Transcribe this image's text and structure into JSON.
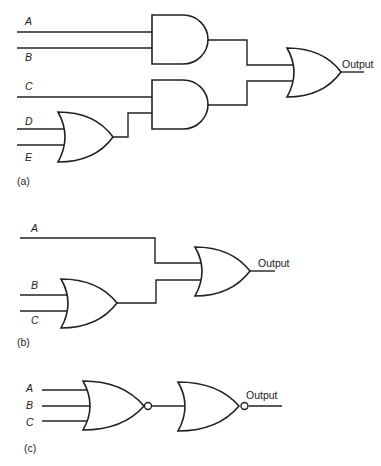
{
  "circuits": {
    "a": {
      "caption": "(a)",
      "inputs": [
        "A",
        "B",
        "C",
        "D",
        "E"
      ],
      "gates": [
        "AND(A,B)",
        "OR(D,E)",
        "AND(C, OR(D,E))",
        "OR(AND1, AND2)"
      ],
      "output_label": "Output"
    },
    "b": {
      "caption": "(b)",
      "inputs": [
        "A",
        "B",
        "C"
      ],
      "gates": [
        "OR(B,C)",
        "OR(A, OR1)"
      ],
      "output_label": "Output"
    },
    "c": {
      "caption": "(c)",
      "inputs": [
        "A",
        "B",
        "C"
      ],
      "gates": [
        "NOR(A,B,C)",
        "NOT/NOR(NOR1)"
      ],
      "output_label": "Output"
    }
  },
  "colors": {
    "stroke": "#222222",
    "background": "#ffffff"
  }
}
